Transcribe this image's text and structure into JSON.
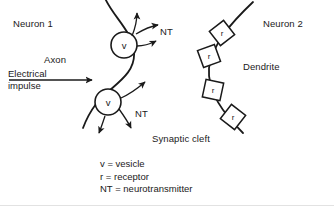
{
  "diagram": {
    "title_labels": {
      "neuron1": "Neuron 1",
      "neuron2": "Neuron 2",
      "axon": "Axon",
      "dendrite": "Dendrite",
      "synaptic_cleft": "Synaptic cleft"
    },
    "impulse": {
      "line1": "Electrical",
      "line2": "impulse"
    },
    "neurotransmitter_labels": [
      "NT",
      "NT"
    ],
    "vesicles": [
      {
        "letter": "v",
        "cx": 124,
        "cy": 45,
        "r": 13
      },
      {
        "letter": "v",
        "cx": 108,
        "cy": 102,
        "r": 13
      }
    ],
    "receptors": [
      {
        "letter": "r",
        "cx": 222,
        "cy": 33
      },
      {
        "letter": "r",
        "cx": 209,
        "cy": 56
      },
      {
        "letter": "r",
        "cx": 213,
        "cy": 90
      },
      {
        "letter": "r",
        "cx": 233,
        "cy": 117
      }
    ],
    "legend": [
      "v = vesicle",
      "r = receptor",
      "NT = neurotransmitter"
    ],
    "colors": {
      "ink": "#1a1a1a",
      "background": "#ffffff",
      "rule": "#e2e2e2"
    }
  }
}
